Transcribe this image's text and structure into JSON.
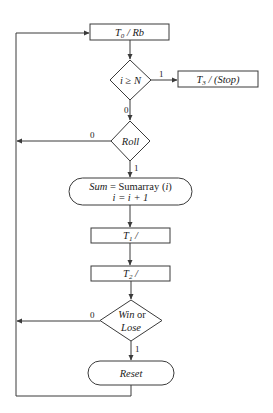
{
  "diagram": {
    "type": "flowchart",
    "nodes": {
      "t0": {
        "label": "T",
        "sub": "0",
        "rest": " / Rb"
      },
      "cond_n": {
        "label_i": "i",
        "label_op": " ≥ ",
        "label_n": "N"
      },
      "t3": {
        "label": "T",
        "sub": "3",
        "rest": " / (Stop)"
      },
      "roll": {
        "label": "Roll"
      },
      "sum": {
        "line1_var": "Sum",
        "line1_rest": " = Sumarray (",
        "line1_arg": "i",
        "line1_close": ")",
        "line2": "i = i + 1"
      },
      "t1": {
        "label": "T",
        "sub": "1",
        "rest": " /"
      },
      "t2": {
        "label": "T",
        "sub": "2",
        "rest": " /"
      },
      "winlose": {
        "line1_a": "Win",
        "line1_b": " or",
        "line2": "Lose"
      },
      "reset": {
        "label": "Reset"
      }
    },
    "edges": {
      "cond_true": "1",
      "cond_false": "0",
      "roll_false": "0",
      "roll_true": "1",
      "winlose_false": "0",
      "winlose_true": "1"
    },
    "colors": {
      "stroke": "#3a3a3a",
      "text": "#222222",
      "background": "#ffffff"
    }
  }
}
